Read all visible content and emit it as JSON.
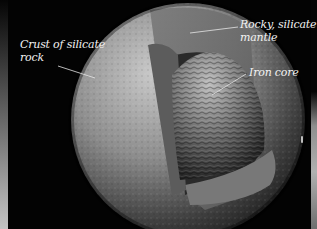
{
  "illustration": {
    "subject": "Cutaway view of a rocky planet's interior",
    "background_color": "#030303",
    "label_color": "#f2f2f2",
    "layers": [
      {
        "name": "crust",
        "label": "Crust of silicate rock",
        "label_lines": [
          "Crust of silicate",
          "rock"
        ],
        "color": "#8f8f8f"
      },
      {
        "name": "mantle",
        "label": "Rocky, silicate mantle",
        "label_lines": [
          "Rocky, silicate",
          "mantle"
        ],
        "color": "#6e6e6e"
      },
      {
        "name": "core",
        "label": "Iron core",
        "label_lines": [
          "Iron core"
        ],
        "color": "#5a5a5a"
      }
    ]
  }
}
